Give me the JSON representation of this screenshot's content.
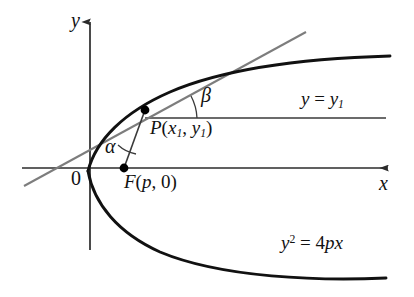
{
  "figure": {
    "kind": "geometry-diagram",
    "width": 414,
    "height": 297,
    "background_color": "#ffffff"
  },
  "axes": {
    "y_axis_label": "y",
    "x_axis_label": "x",
    "origin_label": "0",
    "axis_color": "#2b2b2b"
  },
  "labels": {
    "alpha": "α",
    "beta": "β",
    "point_p": {
      "name": "P",
      "open_paren": "(",
      "x_var": "x",
      "x_sub": "1",
      "comma": ", ",
      "y_var": "y",
      "y_sub": "1",
      "close_paren": ")"
    },
    "focus_f": {
      "name": "F",
      "open_paren": "(",
      "p_var": "p",
      "comma": ", ",
      "zero": "0",
      "close_paren": ")"
    },
    "horizontal_line": {
      "lhs": "y",
      "eq": " = ",
      "rhs_var": "y",
      "rhs_sub": "1"
    },
    "parabola_equation": {
      "lhs_var": "y",
      "lhs_sup": "2",
      "eq": " = 4",
      "rhs": "px"
    }
  },
  "colors": {
    "curve": "#111111",
    "tangent": "#7d7d7d",
    "axis": "#2b2b2b",
    "thin_line": "#3a3a3a",
    "point_fill": "#000000"
  },
  "geometry": {
    "parabola_vertex": [
      88,
      171
    ],
    "focus_point": [
      124,
      168
    ],
    "tangency_point_p": [
      145,
      110
    ],
    "y_axis_x": 90,
    "x_axis_y": 168,
    "y1_line_y": 118,
    "y1_line_x_start": 145,
    "y1_line_x_end": 386,
    "tangent_start": [
      24,
      186
    ],
    "tangent_end": [
      306,
      32
    ]
  }
}
